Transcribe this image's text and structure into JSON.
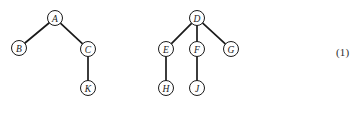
{
  "figure": {
    "background_color": "#ffffff",
    "node_fill_color": "#ffffff",
    "node_stroke_color": "#1a1a1a",
    "edge_color": "#1a1a1a",
    "label_color": "#1a1a1a",
    "node_radius": 7.5,
    "equation_number": "(1)",
    "equation_number_x": 336,
    "equation_number_y": 53
  },
  "chart_data": {
    "type": "diagram",
    "title": "",
    "subtitle": "",
    "xlabel": "",
    "ylabel": "",
    "diagram_kind": "rooted-tree-forest",
    "graphs": [
      {
        "name": "left-tree",
        "root": "A",
        "nodes": [
          {
            "id": "A",
            "label": "A",
            "x": 55,
            "y": 18
          },
          {
            "id": "B",
            "label": "B",
            "x": 19,
            "y": 48
          },
          {
            "id": "C",
            "label": "C",
            "x": 88,
            "y": 49
          },
          {
            "id": "K",
            "label": "K",
            "x": 88,
            "y": 88
          }
        ],
        "edges": [
          {
            "from": "A",
            "to": "B"
          },
          {
            "from": "A",
            "to": "C"
          },
          {
            "from": "C",
            "to": "K"
          }
        ]
      },
      {
        "name": "right-tree",
        "root": "D",
        "nodes": [
          {
            "id": "D",
            "label": "D",
            "x": 197,
            "y": 18
          },
          {
            "id": "E",
            "label": "E",
            "x": 166,
            "y": 49
          },
          {
            "id": "F",
            "label": "F",
            "x": 197,
            "y": 49
          },
          {
            "id": "G",
            "label": "G",
            "x": 231,
            "y": 49
          },
          {
            "id": "H",
            "label": "H",
            "x": 166,
            "y": 88
          },
          {
            "id": "J",
            "label": "J",
            "x": 197,
            "y": 88
          }
        ],
        "edges": [
          {
            "from": "D",
            "to": "E"
          },
          {
            "from": "D",
            "to": "F"
          },
          {
            "from": "D",
            "to": "G"
          },
          {
            "from": "E",
            "to": "H"
          },
          {
            "from": "F",
            "to": "J"
          }
        ]
      }
    ]
  }
}
